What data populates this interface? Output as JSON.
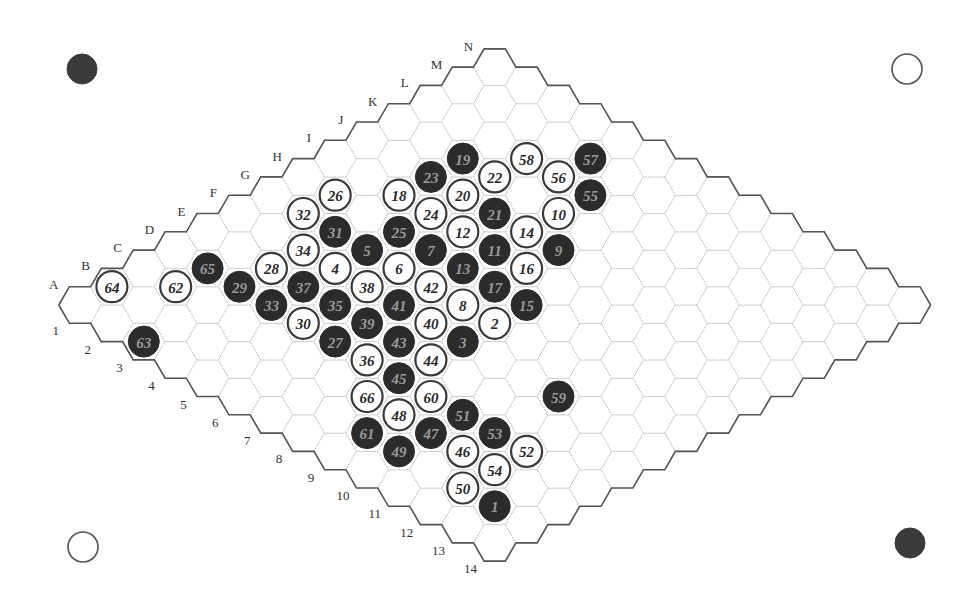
{
  "game": {
    "type": "Hex",
    "board_size": 14,
    "row_letters": [
      "A",
      "B",
      "C",
      "D",
      "E",
      "F",
      "G",
      "H",
      "I",
      "J",
      "K",
      "L",
      "M",
      "N"
    ],
    "col_numbers": [
      "1",
      "2",
      "3",
      "4",
      "5",
      "6",
      "7",
      "8",
      "9",
      "10",
      "11",
      "12",
      "13",
      "14"
    ],
    "corner_markers": [
      {
        "position": "top-left",
        "color": "black",
        "x": 82,
        "y": 69
      },
      {
        "position": "top-right",
        "color": "white",
        "x": 907,
        "y": 69
      },
      {
        "position": "bottom-left",
        "color": "white",
        "x": 83,
        "y": 547
      },
      {
        "position": "bottom-right",
        "color": "black",
        "x": 910,
        "y": 543
      }
    ],
    "moves": [
      {
        "n": 1,
        "color": "black",
        "cell": "B13"
      },
      {
        "n": 2,
        "color": "white",
        "cell": "G8"
      },
      {
        "n": 3,
        "color": "black",
        "cell": "F8"
      },
      {
        "n": 4,
        "color": "white",
        "cell": "F4"
      },
      {
        "n": 5,
        "color": "black",
        "cell": "G4"
      },
      {
        "n": 6,
        "color": "white",
        "cell": "G5"
      },
      {
        "n": 7,
        "color": "black",
        "cell": "H5"
      },
      {
        "n": 8,
        "color": "white",
        "cell": "G7"
      },
      {
        "n": 9,
        "color": "black",
        "cell": "J7"
      },
      {
        "n": 10,
        "color": "white",
        "cell": "K6"
      },
      {
        "n": 11,
        "color": "black",
        "cell": "I6"
      },
      {
        "n": 12,
        "color": "white",
        "cell": "I5"
      },
      {
        "n": 13,
        "color": "black",
        "cell": "H6"
      },
      {
        "n": 14,
        "color": "white",
        "cell": "J6"
      },
      {
        "n": 15,
        "color": "black",
        "cell": "H8"
      },
      {
        "n": 16,
        "color": "white",
        "cell": "I7"
      },
      {
        "n": 17,
        "color": "black",
        "cell": "H7"
      },
      {
        "n": 18,
        "color": "white",
        "cell": "I3"
      },
      {
        "n": 19,
        "color": "black",
        "cell": "K3"
      },
      {
        "n": 20,
        "color": "white",
        "cell": "J4"
      },
      {
        "n": 21,
        "color": "black",
        "cell": "J5"
      },
      {
        "n": 22,
        "color": "white",
        "cell": "K4"
      },
      {
        "n": 23,
        "color": "black",
        "cell": "J3"
      },
      {
        "n": 24,
        "color": "white",
        "cell": "I4"
      },
      {
        "n": 25,
        "color": "black",
        "cell": "H4"
      },
      {
        "n": 26,
        "color": "white",
        "cell": "H2"
      },
      {
        "n": 27,
        "color": "black",
        "cell": "D6"
      },
      {
        "n": 28,
        "color": "white",
        "cell": "E3"
      },
      {
        "n": 29,
        "color": "black",
        "cell": "D3"
      },
      {
        "n": 30,
        "color": "white",
        "cell": "D5"
      },
      {
        "n": 31,
        "color": "black",
        "cell": "G3"
      },
      {
        "n": 32,
        "color": "white",
        "cell": "G2"
      },
      {
        "n": 33,
        "color": "black",
        "cell": "D4"
      },
      {
        "n": 34,
        "color": "white",
        "cell": "F3"
      },
      {
        "n": 35,
        "color": "black",
        "cell": "E5"
      },
      {
        "n": 36,
        "color": "white",
        "cell": "D7"
      },
      {
        "n": 37,
        "color": "black",
        "cell": "E4"
      },
      {
        "n": 38,
        "color": "white",
        "cell": "F5"
      },
      {
        "n": 39,
        "color": "black",
        "cell": "E6"
      },
      {
        "n": 40,
        "color": "white",
        "cell": "F7"
      },
      {
        "n": 41,
        "color": "black",
        "cell": "F6"
      },
      {
        "n": 42,
        "color": "white",
        "cell": "G6"
      },
      {
        "n": 43,
        "color": "black",
        "cell": "E7"
      },
      {
        "n": 44,
        "color": "white",
        "cell": "E8"
      },
      {
        "n": 45,
        "color": "black",
        "cell": "D8"
      },
      {
        "n": 46,
        "color": "white",
        "cell": "C11"
      },
      {
        "n": 47,
        "color": "black",
        "cell": "C10"
      },
      {
        "n": 48,
        "color": "white",
        "cell": "C9"
      },
      {
        "n": 49,
        "color": "black",
        "cell": "B10"
      },
      {
        "n": 50,
        "color": "white",
        "cell": "B12"
      },
      {
        "n": 51,
        "color": "black",
        "cell": "D10"
      },
      {
        "n": 52,
        "color": "white",
        "cell": "D12"
      },
      {
        "n": 53,
        "color": "black",
        "cell": "D11"
      },
      {
        "n": 54,
        "color": "white",
        "cell": "C12"
      },
      {
        "n": 55,
        "color": "black",
        "cell": "L6"
      },
      {
        "n": 56,
        "color": "white",
        "cell": "L5"
      },
      {
        "n": 57,
        "color": "black",
        "cell": "M5"
      },
      {
        "n": 58,
        "color": "white",
        "cell": "L4"
      },
      {
        "n": 59,
        "color": "black",
        "cell": "F11"
      },
      {
        "n": 60,
        "color": "white",
        "cell": "D9"
      },
      {
        "n": 61,
        "color": "black",
        "cell": "B9"
      },
      {
        "n": 62,
        "color": "white",
        "cell": "C2"
      },
      {
        "n": 63,
        "color": "black",
        "cell": "A3"
      },
      {
        "n": 64,
        "color": "white",
        "cell": "B1"
      },
      {
        "n": 65,
        "color": "black",
        "cell": "D2"
      },
      {
        "n": 66,
        "color": "white",
        "cell": "C8"
      }
    ]
  },
  "colors": {
    "black_stone": "#2b2b2b",
    "white_stone": "#ffffff",
    "border": "#555555",
    "grid": "#b8b8b8"
  }
}
